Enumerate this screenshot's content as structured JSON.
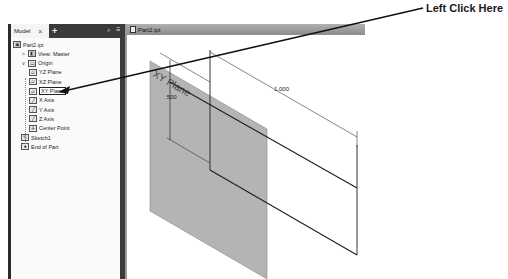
{
  "callout": {
    "text": "Left Click Here",
    "target": "XY Plane"
  },
  "browser": {
    "tab_label": "Model",
    "close_glyph": "×",
    "add_glyph": "+",
    "search_glyph": "⌕",
    "menu_glyph": "≡",
    "items": [
      {
        "label": "Part2.ipt",
        "icon": "part-icon",
        "indent": 0,
        "expander": ""
      },
      {
        "label": "View: Master",
        "icon": "view-icon",
        "indent": 1,
        "expander": ">"
      },
      {
        "label": "Origin",
        "icon": "folder-icon",
        "indent": 1,
        "expander": "v"
      },
      {
        "label": "YZ Plane",
        "icon": "plane-icon",
        "indent": 2,
        "expander": ""
      },
      {
        "label": "XZ Plane",
        "icon": "plane-icon",
        "indent": 2,
        "expander": ""
      },
      {
        "label": "XY Plane",
        "icon": "plane-icon",
        "indent": 2,
        "expander": "",
        "selected": true
      },
      {
        "label": "X Axis",
        "icon": "axis-icon",
        "indent": 2,
        "expander": ""
      },
      {
        "label": "Y Axis",
        "icon": "axis-icon",
        "indent": 2,
        "expander": ""
      },
      {
        "label": "Z Axis",
        "icon": "axis-icon",
        "indent": 2,
        "expander": ""
      },
      {
        "label": "Center Point",
        "icon": "point-icon",
        "indent": 2,
        "expander": ""
      },
      {
        "label": "Sketch1",
        "icon": "sketch-icon",
        "indent": 1,
        "expander": ""
      },
      {
        "label": "End of Part",
        "icon": "end-of-part-icon",
        "indent": 1,
        "expander": ""
      }
    ]
  },
  "viewport": {
    "tab_label": "Part2.ipt",
    "plane_label": "XY Plane",
    "dimensions": {
      "height": ".500",
      "width": "1.000"
    },
    "colors": {
      "plane_fill": "#b4b4b4",
      "sketch_line": "#1e1e1e"
    }
  }
}
